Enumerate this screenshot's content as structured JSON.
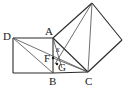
{
  "figure": {
    "kind": "geometry-diagram",
    "canvas": {
      "width": 127,
      "height": 95,
      "background": "#ffffff"
    },
    "stroke_color": "#2b2b2b",
    "thin_stroke_color": "#4a4a4a",
    "label_color": "#1a1a1a",
    "points": {
      "D": {
        "x": 13,
        "y": 38
      },
      "A": {
        "x": 53,
        "y": 38
      },
      "B": {
        "x": 53,
        "y": 73
      },
      "E": {
        "x": 13,
        "y": 73
      },
      "C": {
        "x": 88,
        "y": 72
      },
      "F": {
        "x": 53,
        "y": 58
      },
      "G": {
        "x": 57,
        "y": 65
      },
      "T1": {
        "x": 92,
        "y": 3
      },
      "T2": {
        "x": 122,
        "y": 40
      }
    },
    "labels": [
      {
        "id": "label-D",
        "text": "D",
        "x": 3,
        "y": 31
      },
      {
        "id": "label-A",
        "text": "A",
        "x": 45,
        "y": 26
      },
      {
        "id": "label-B",
        "text": "B",
        "x": 49,
        "y": 76
      },
      {
        "id": "label-C",
        "text": "C",
        "x": 85,
        "y": 76
      },
      {
        "id": "label-F",
        "text": "F",
        "x": 44,
        "y": 53
      },
      {
        "id": "label-G",
        "text": "G",
        "x": 58,
        "y": 62
      }
    ],
    "angle_marks": [
      {
        "id": "angle-x",
        "text": "x",
        "x": 56,
        "y": 46
      }
    ]
  }
}
